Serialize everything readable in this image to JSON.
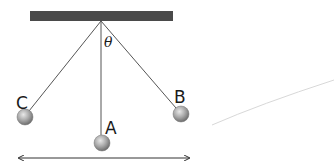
{
  "diagram": {
    "support_bar": {
      "x": 30,
      "y": 11,
      "width": 143,
      "height": 10,
      "color": "#4a4a4a"
    },
    "pivot": {
      "x": 101,
      "y": 21
    },
    "angle_label": "θ",
    "positions": [
      {
        "label": "A",
        "x": 102,
        "y": 143,
        "radius": 8,
        "description": "lowest point"
      },
      {
        "label": "B",
        "x": 181,
        "y": 114,
        "radius": 8,
        "description": "right extreme"
      },
      {
        "label": "C",
        "x": 25,
        "y": 117,
        "radius": 8,
        "description": "left extreme"
      }
    ],
    "swing_arrow": {
      "x1": 17,
      "x2": 191,
      "y": 158
    },
    "stray_line": {
      "x1": 212,
      "y1": 125,
      "x2": 334,
      "y2": 80,
      "color": "#d8d8d8"
    }
  }
}
